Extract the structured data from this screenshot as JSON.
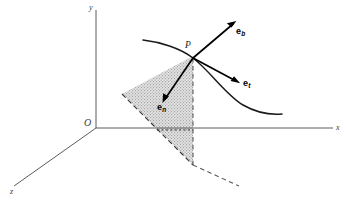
{
  "figure": {
    "background_color": "#ffffff",
    "width": 347,
    "height": 203
  },
  "axes": {
    "origin_label": "O",
    "x_label": "x",
    "y_label": "y",
    "z_label": "z",
    "axis_color": "#4a4a4a"
  },
  "point": {
    "label": "P"
  },
  "vectors": [
    {
      "id": "binormal",
      "base": "e",
      "subscript": "b",
      "direction": "up-right",
      "color": "#000000"
    },
    {
      "id": "tangent",
      "base": "e",
      "subscript": "t",
      "direction": "down-right",
      "color": "#000000"
    },
    {
      "id": "normal",
      "base": "e",
      "subscript": "n",
      "direction": "down-left",
      "color": "#000000"
    }
  ],
  "curve": {
    "name": "space-curve",
    "color": "#1a1a1a"
  },
  "plane": {
    "name": "osculating-plane",
    "fill_style": "hatched-gray",
    "fill_color": "#c9c9c9",
    "edge_style": "dashed",
    "edge_color": "#3a3a3a"
  }
}
